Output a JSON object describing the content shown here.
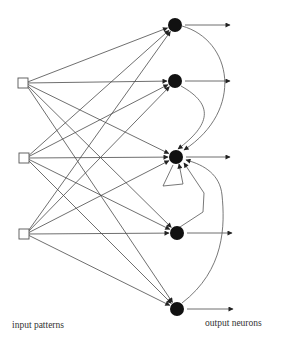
{
  "diagram": {
    "labels": {
      "input": "input patterns",
      "output": "output neurons"
    },
    "colors": {
      "edge": "#4a4a4a",
      "output_node": "#111111",
      "input_node_stroke": "#555555",
      "background": "#ffffff"
    },
    "input_nodes": [
      {
        "id": "i1",
        "x": 23,
        "y": 83,
        "size": 10
      },
      {
        "id": "i2",
        "x": 24,
        "y": 158,
        "size": 10
      },
      {
        "id": "i3",
        "x": 24,
        "y": 234,
        "size": 10
      }
    ],
    "output_nodes": [
      {
        "id": "o1",
        "x": 175,
        "y": 25,
        "r": 7,
        "out_to_x": 230
      },
      {
        "id": "o2",
        "x": 175,
        "y": 81,
        "r": 7,
        "out_to_x": 230
      },
      {
        "id": "o3",
        "x": 176,
        "y": 157,
        "r": 7,
        "out_to_x": 230
      },
      {
        "id": "o4",
        "x": 177,
        "y": 233,
        "r": 7,
        "out_to_x": 232
      },
      {
        "id": "o5",
        "x": 177,
        "y": 309,
        "r": 7,
        "out_to_x": 233
      }
    ],
    "connectivity": "full input-to-output (3 x 5 = 15 feedforward connections)",
    "feedback_edges": [
      {
        "from": "o1",
        "to": "o3",
        "path": "M182,26 C232,40 245,110 184,150"
      },
      {
        "from": "o2",
        "to": "o3",
        "path": "M181,86 C215,105 210,125 178,149"
      },
      {
        "from": "o3",
        "to": "o3",
        "path": "M173,165 L163,186 L183,184 L179,164"
      },
      {
        "from": "o4",
        "to": "o3",
        "path": "M180,227 L203,212 L204,193 L184,163"
      },
      {
        "from": "o5",
        "to": "o3",
        "path": "M182,303 C225,270 225,225 222,195 C220,175 205,165 186,160"
      }
    ]
  }
}
